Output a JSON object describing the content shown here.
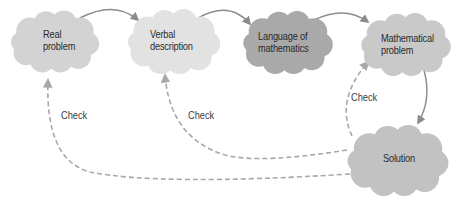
{
  "nodes": [
    {
      "id": "real",
      "line1": "Real",
      "line2": "problem",
      "fill": "#d3d3d3"
    },
    {
      "id": "verbal",
      "line1": "Verbal",
      "line2": "description",
      "fill": "#e2e2e2"
    },
    {
      "id": "language",
      "line1": "Language of",
      "line2": "mathematics",
      "fill": "#a9a9a9"
    },
    {
      "id": "math",
      "line1": "Mathematical",
      "line2": "problem",
      "fill": "#c9c9c9"
    },
    {
      "id": "solution",
      "line1": "Solution",
      "line2": "",
      "fill": "#c2c2c2"
    }
  ],
  "edges": {
    "forward_color": "#8c8c8c",
    "check_color": "#a8a8a8",
    "check_labels": [
      "Check",
      "Check",
      "Check"
    ]
  }
}
